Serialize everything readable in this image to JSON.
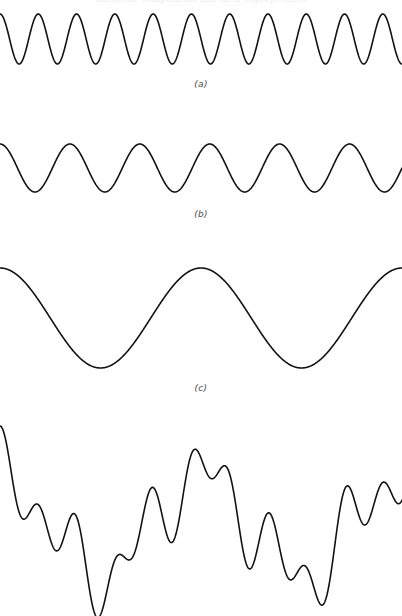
{
  "figure": {
    "title_clipped": "harmonic components and their superposition",
    "background_color": "#ffffff",
    "stroke_color": "#121212",
    "label_color": "#4a4a4a",
    "width": 402,
    "height": 616
  },
  "panels": [
    {
      "id": "a",
      "label": "(a)",
      "name": "high-frequency-component"
    },
    {
      "id": "b",
      "label": "(b)",
      "name": "mid-frequency-component"
    },
    {
      "id": "c",
      "label": "(c)",
      "name": "low-frequency-component"
    },
    {
      "id": "d",
      "label": "",
      "name": "superposition-sum"
    }
  ],
  "chart_data": [
    {
      "type": "line",
      "title": "(a)",
      "waveform": "cosine",
      "cycles": 10.5,
      "period_px": 38.3,
      "amplitude": 25,
      "center_y": 39,
      "y_top": 14,
      "y_bottom": 64,
      "phase_deg": 0,
      "x": [
        0,
        402
      ],
      "xlabel": "",
      "ylabel": "",
      "grid": false,
      "legend": "none"
    },
    {
      "type": "line",
      "title": "(b)",
      "waveform": "cosine",
      "cycles": 5.75,
      "period_px": 69.9,
      "amplitude": 24,
      "center_y": 168,
      "y_top": 144,
      "y_bottom": 192,
      "phase_deg": 0,
      "x": [
        0,
        402
      ],
      "xlabel": "",
      "ylabel": "",
      "grid": false,
      "legend": "none"
    },
    {
      "type": "line",
      "title": "(c)",
      "waveform": "cosine",
      "cycles": 2.0,
      "period_px": 201,
      "amplitude": 50,
      "center_y": 318,
      "y_top": 268,
      "y_bottom": 368,
      "phase_deg": 0,
      "x": [
        0,
        402
      ],
      "xlabel": "",
      "ylabel": "",
      "grid": false,
      "legend": "none"
    },
    {
      "type": "line",
      "title": "",
      "waveform": "sum-of-cosines",
      "components": [
        {
          "cycles": 10.5,
          "amplitude": 25
        },
        {
          "cycles": 5.75,
          "amplitude": 24
        },
        {
          "cycles": 2.0,
          "amplitude": 50
        }
      ],
      "center_y": 525,
      "clipped_at_bottom": true,
      "x": [
        0,
        402
      ],
      "xlabel": "",
      "ylabel": "",
      "grid": false,
      "legend": "none"
    }
  ]
}
